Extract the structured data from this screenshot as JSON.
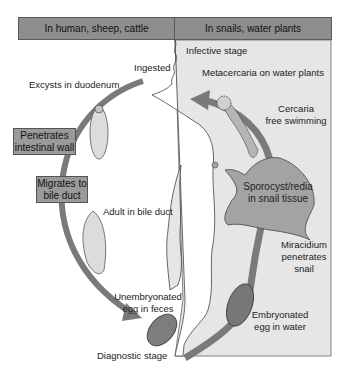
{
  "header": {
    "left": "In human, sheep, cattle",
    "right": "In snails, water plants"
  },
  "colors": {
    "header_fill": "#8e8e8e",
    "right_panel": "#e6e6e6",
    "arrow": "#8a8a8a",
    "snail": "#a3a3a3",
    "box_fill": "#9a9a9a"
  },
  "labels": {
    "infective_stage": "Infective stage",
    "ingested": "Ingested",
    "excysts": "Excysts in duodenum",
    "metacercaria": "Metacercaria on water plants",
    "cercaria_1": "Cercaria",
    "cercaria_2": "free swimming",
    "adult": "Adult in bile duct",
    "miracidium_1": "Miracidium",
    "miracidium_2": "penetrates",
    "miracidium_3": "snail",
    "unembryonated_1": "Unembryonated",
    "unembryonated_2": "egg in feces",
    "embryonated_1": "Embryonated",
    "embryonated_2": "egg in water",
    "diagnostic": "Diagnostic stage"
  },
  "boxes": {
    "penetrates_1": "Penetrates",
    "penetrates_2": "intestinal wall",
    "migrates_1": "Migrates to",
    "migrates_2": "bile duct"
  },
  "snail": {
    "line1": "Sporocyst/redia",
    "line2": "in snail tissue"
  }
}
